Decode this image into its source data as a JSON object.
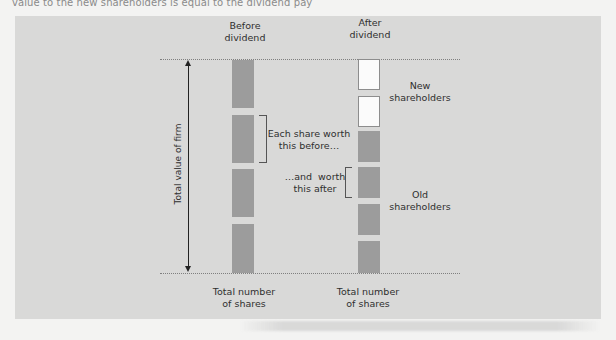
{
  "page": {
    "caption_fragment": "value to the new shareholders is equal to the dividend pay"
  },
  "diagram": {
    "title_before": "Before\ndividend",
    "title_before_line1": "Before",
    "title_before_line2": "dividend",
    "title_after_line1": "After",
    "title_after_line2": "dividend",
    "axis_label": "Total value of firm",
    "annotation_before_line1": "Each share worth",
    "annotation_before_line2": "this before…",
    "annotation_after_line1": "…and  worth",
    "annotation_after_line2": "this after",
    "new_holders_line1": "New",
    "new_holders_line2": "shareholders",
    "old_holders_line1": "Old",
    "old_holders_line2": "shareholders",
    "bottom_before_line1": "Total number",
    "bottom_before_line2": "of shares",
    "bottom_after_line1": "Total number",
    "bottom_after_line2": "of shares",
    "before_column": {
      "shares": 4,
      "share_type": "old"
    },
    "after_column": {
      "shares": 6,
      "new_shares": 2,
      "old_shares": 4
    },
    "colors": {
      "panel": "#d9d9d8",
      "old_share": "#9c9c9c",
      "new_share": "#fbfbfb",
      "page": "#f3f3f2"
    }
  }
}
